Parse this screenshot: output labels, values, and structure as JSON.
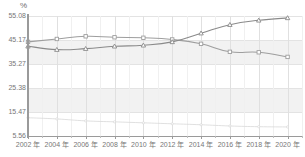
{
  "chart_data": {
    "type": "line",
    "title": "",
    "subtitle": "",
    "xlabel": "",
    "ylabel": "%",
    "unit_label": "%",
    "grid": true,
    "legend": "none",
    "xlim": [
      2002,
      2021
    ],
    "ylim": [
      5.56,
      55.08
    ],
    "yticks": [
      55.08,
      45.17,
      35.27,
      25.38,
      15.47,
      5.56
    ],
    "ytick_labels": [
      "55.08",
      "45.17",
      "35.27",
      "25.38",
      "15.47",
      "5.56"
    ],
    "xticks": [
      2002,
      2004,
      2006,
      2008,
      2010,
      2012,
      2014,
      2016,
      2018,
      2020
    ],
    "xtick_labels": [
      "2002 年",
      "2004 年",
      "2006 年",
      "2008 年",
      "2010 年",
      "2012 年",
      "2014 年",
      "2016 年",
      "2018 年",
      "2020 年"
    ],
    "x": [
      2002,
      2004,
      2006,
      2008,
      2010,
      2012,
      2014,
      2016,
      2018,
      2020
    ],
    "series": [
      {
        "name": "series-upper",
        "color": "#9e9e9e",
        "marker": "square",
        "values": [
          44.4,
          45.6,
          46.7,
          46.3,
          46.1,
          45.4,
          43.6,
          40.3,
          40.1,
          38.2
        ]
      },
      {
        "name": "series-lower",
        "color": "#8a8a8a",
        "marker": "triangle",
        "values": [
          42.6,
          41.2,
          41.6,
          42.6,
          43.0,
          44.4,
          48.0,
          51.5,
          53.3,
          54.3
        ]
      },
      {
        "name": "series-faint",
        "color": "#d8d8d8",
        "marker": "dot",
        "values": [
          13.1,
          12.6,
          11.8,
          11.4,
          11.0,
          10.6,
          10.2,
          9.7,
          9.4,
          9.3
        ]
      }
    ],
    "crossing_year": 2013
  }
}
